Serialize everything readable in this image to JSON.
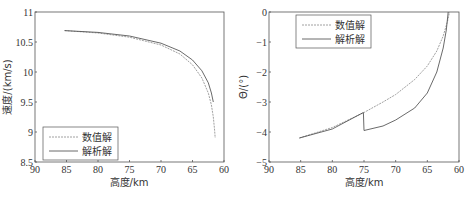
{
  "chart_data": [
    {
      "type": "line",
      "title": "",
      "xlabel": "高度/km",
      "ylabel": "速度/(km/s)",
      "xlim": [
        90,
        60
      ],
      "ylim": [
        8.5,
        11
      ],
      "x_reversed": true,
      "xticks": [
        "90",
        "85",
        "80",
        "75",
        "70",
        "65",
        "60"
      ],
      "yticks": [
        "8.5",
        "9",
        "9.5",
        "10",
        "10.5",
        "11"
      ],
      "grid": false,
      "legend_position": "lower left",
      "series": [
        {
          "name": "数值解",
          "style": "dashed",
          "x": [
            85.3,
            80,
            75,
            70,
            67,
            65,
            63.5,
            62.5,
            62,
            61.7,
            61.5,
            61.4
          ],
          "y": [
            10.69,
            10.65,
            10.58,
            10.45,
            10.3,
            10.12,
            9.9,
            9.65,
            9.45,
            9.25,
            9.05,
            8.9
          ]
        },
        {
          "name": "解析解",
          "style": "solid",
          "x": [
            85.3,
            80,
            75,
            70,
            67,
            65,
            63.5,
            62.5,
            62,
            61.7
          ],
          "y": [
            10.69,
            10.66,
            10.6,
            10.48,
            10.35,
            10.2,
            10.02,
            9.82,
            9.65,
            9.5
          ]
        }
      ]
    },
    {
      "type": "line",
      "title": "",
      "xlabel": "高度/km",
      "ylabel": "Θ/(°)",
      "xlim": [
        90,
        60
      ],
      "ylim": [
        -5,
        0
      ],
      "x_reversed": true,
      "xticks": [
        "90",
        "85",
        "80",
        "75",
        "70",
        "65",
        "60"
      ],
      "yticks": [
        "-5",
        "-4",
        "-3",
        "-2",
        "-1",
        "0"
      ],
      "grid": false,
      "legend_position": "upper left",
      "series": [
        {
          "name": "数值解",
          "style": "dashed",
          "x": [
            85.2,
            80,
            75,
            72,
            70,
            67,
            65,
            63.5,
            62.5,
            61.8,
            61.5
          ],
          "y": [
            -4.2,
            -3.85,
            -3.35,
            -3.0,
            -2.75,
            -2.25,
            -1.8,
            -1.3,
            -0.8,
            -0.3,
            0.0
          ]
        },
        {
          "name": "解析解",
          "style": "solid",
          "x": [
            85.2,
            80,
            75.1,
            75,
            72,
            70,
            67,
            65,
            63.5,
            62.5,
            62,
            61.7
          ],
          "y": [
            -4.2,
            -3.9,
            -3.35,
            -3.95,
            -3.8,
            -3.6,
            -3.2,
            -2.7,
            -2.0,
            -1.2,
            -0.6,
            0.0
          ]
        }
      ]
    }
  ],
  "legend": {
    "numerical": "数值解",
    "analytical": "解析解"
  },
  "left_plot": {
    "xlabel": "高度/km",
    "ylabel": "速度/(km/s)"
  },
  "right_plot": {
    "xlabel": "高度/km",
    "ylabel": "Θ/(°)"
  }
}
